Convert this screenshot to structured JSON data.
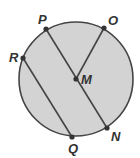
{
  "diagram": {
    "type": "circle-geometry",
    "circle": {
      "cx": 76,
      "cy": 79,
      "r": 57,
      "fill": "#d3d3d3",
      "stroke": "#444444"
    },
    "center": {
      "label": "M",
      "x": 76,
      "y": 79
    },
    "points": [
      {
        "label": "P",
        "x": 46,
        "y": 29
      },
      {
        "label": "O",
        "x": 104,
        "y": 28
      },
      {
        "label": "R",
        "x": 23,
        "y": 58
      },
      {
        "label": "N",
        "x": 107,
        "y": 128
      },
      {
        "label": "Q",
        "x": 72,
        "y": 137
      }
    ],
    "segments": [
      {
        "name": "PN",
        "from": "P",
        "to": "N",
        "note": "diameter through M"
      },
      {
        "name": "MO",
        "from": "M",
        "to": "O",
        "note": "radius"
      },
      {
        "name": "RQ",
        "from": "R",
        "to": "Q",
        "note": "chord parallel to PN"
      }
    ],
    "labels": {
      "P": "P",
      "O": "O",
      "R": "R",
      "M": "M",
      "N": "N",
      "Q": "Q"
    }
  }
}
